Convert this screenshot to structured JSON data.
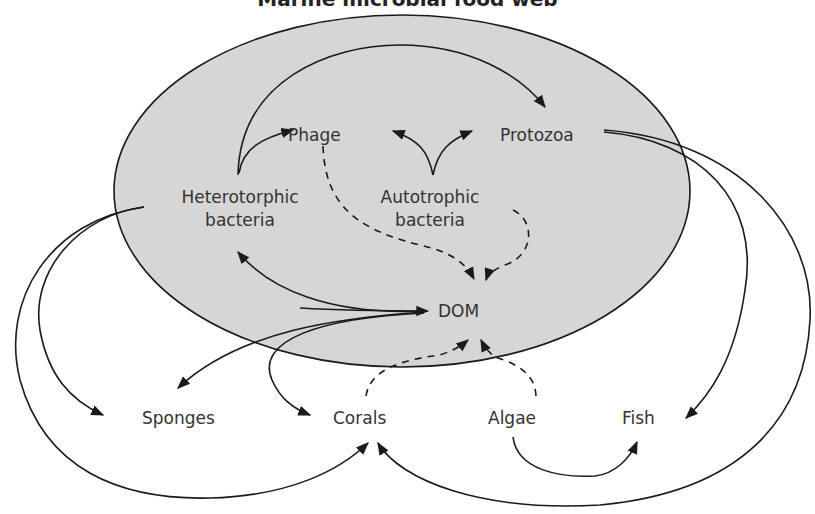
{
  "title": "Marine microbial food web",
  "colors": {
    "ellipse_fill": "#d6d6d6",
    "stroke": "#1a1a1a",
    "text": "#333333",
    "background": "#ffffff"
  },
  "region": {
    "label": "microbial loop (shaded ellipse)",
    "contains": [
      "Phage",
      "Protozoa",
      "Heterotorphic bacteria",
      "Autotrophic bacteria",
      "DOM"
    ]
  },
  "nodes": {
    "phage": "Phage",
    "protozoa": "Protozoa",
    "hetero_1": "Heterotorphic",
    "hetero_2": "bacteria",
    "auto_1": "Autotrophic",
    "auto_2": "bacteria",
    "dom": "DOM",
    "sponges": "Sponges",
    "corals": "Corals",
    "algae": "Algae",
    "fish": "Fish"
  },
  "edges": [
    {
      "from": "Heterotorphic bacteria",
      "to": "Protozoa",
      "style": "solid"
    },
    {
      "from": "Heterotorphic bacteria",
      "to": "Phage",
      "style": "solid"
    },
    {
      "from": "Autotrophic bacteria",
      "to": "Phage",
      "style": "solid"
    },
    {
      "from": "Autotrophic bacteria",
      "to": "Protozoa",
      "style": "solid"
    },
    {
      "from": "Phage",
      "to": "DOM",
      "style": "dashed"
    },
    {
      "from": "Autotrophic bacteria",
      "to": "DOM",
      "style": "dashed"
    },
    {
      "from": "DOM",
      "to": "Heterotorphic bacteria",
      "style": "solid"
    },
    {
      "from": "Heterotorphic bacteria",
      "to": "DOM",
      "style": "solid"
    },
    {
      "from": "DOM",
      "to": "Sponges",
      "style": "solid"
    },
    {
      "from": "DOM",
      "to": "Corals",
      "style": "solid"
    },
    {
      "from": "Heterotorphic bacteria",
      "to": "Sponges",
      "style": "solid"
    },
    {
      "from": "Heterotorphic bacteria",
      "to": "Corals",
      "style": "solid"
    },
    {
      "from": "Corals",
      "to": "DOM",
      "style": "dashed"
    },
    {
      "from": "Algae",
      "to": "DOM",
      "style": "dashed"
    },
    {
      "from": "Algae",
      "to": "Fish",
      "style": "solid"
    },
    {
      "from": "Protozoa",
      "to": "Fish",
      "style": "solid"
    },
    {
      "from": "Protozoa",
      "to": "Corals",
      "style": "solid"
    }
  ]
}
